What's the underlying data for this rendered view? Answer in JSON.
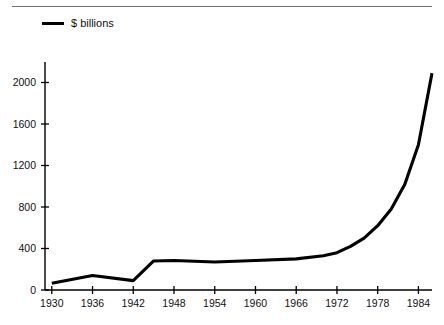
{
  "figure": {
    "legend_label": "$ billions",
    "legend_marker": "line-swatch",
    "line_color": "#000000",
    "axis_color": "#000000",
    "background": "#ffffff",
    "rule_color": "#6f6f6f"
  },
  "chart_data": {
    "type": "line",
    "title": "",
    "subtitle": "",
    "xlabel": "",
    "ylabel": "",
    "legend": [
      "$ billions"
    ],
    "legend_position": "top-left",
    "grid": false,
    "xlim": [
      1929,
      1986
    ],
    "ylim": [
      0,
      2200
    ],
    "xticks": [
      1930,
      1936,
      1942,
      1948,
      1954,
      1960,
      1966,
      1972,
      1978,
      1984
    ],
    "xticklabels": [
      "1930",
      "1936",
      "1942",
      "1948",
      "1954",
      "1960",
      "1966",
      "1972",
      "1978",
      "1984"
    ],
    "yticks": [
      0,
      400,
      800,
      1200,
      1600,
      2000
    ],
    "yticklabels": [
      "0",
      "400",
      "800",
      "1200",
      "1600",
      "2000"
    ],
    "series": [
      {
        "name": "$ billions",
        "x": [
          1930,
          1936,
          1942,
          1945,
          1948,
          1954,
          1960,
          1966,
          1970,
          1972,
          1974,
          1976,
          1978,
          1980,
          1982,
          1984,
          1986
        ],
        "values": [
          65,
          140,
          90,
          280,
          285,
          270,
          285,
          300,
          330,
          360,
          420,
          500,
          620,
          780,
          1020,
          1400,
          2090
        ]
      }
    ]
  }
}
